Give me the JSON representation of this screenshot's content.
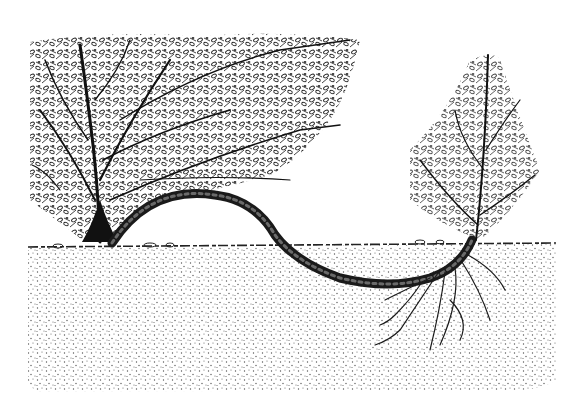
{
  "image": {
    "subject": "Layering propagation of a shrub",
    "elements": [
      "parent-shrub",
      "arched-layered-stem",
      "ground-line",
      "stippled-soil",
      "new-shoot",
      "new-roots"
    ],
    "colors": {
      "ink": "#1a1a1a",
      "paper": "#ffffff",
      "stipple": "#555555"
    }
  }
}
